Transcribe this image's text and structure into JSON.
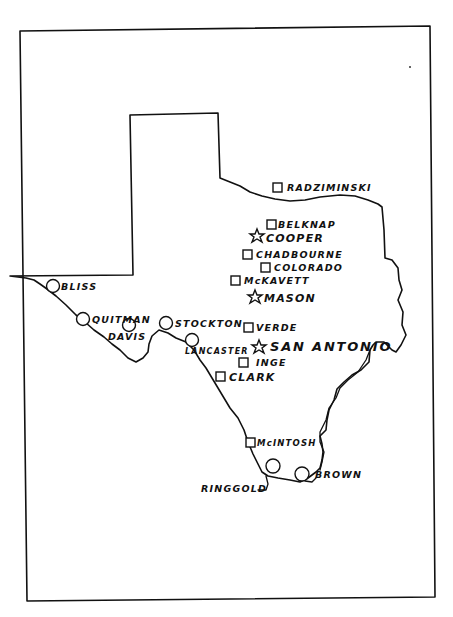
{
  "map": {
    "subject": "Texas frontier forts",
    "legend_symbols": {
      "square": "fort",
      "circle": "fort",
      "star": "fort / city"
    },
    "places": [
      {
        "id": "radziminski",
        "name": "RADZIMINSKI",
        "symbol": "square"
      },
      {
        "id": "belknap",
        "name": "BELKNAP",
        "symbol": "square"
      },
      {
        "id": "cooper",
        "name": "COOPER",
        "symbol": "star"
      },
      {
        "id": "chadbourne",
        "name": "CHADBOURNE",
        "symbol": "square"
      },
      {
        "id": "colorado",
        "name": "COLORADO",
        "symbol": "square"
      },
      {
        "id": "mckavett",
        "name": "McKAVETT",
        "symbol": "square"
      },
      {
        "id": "mason",
        "name": "MASON",
        "symbol": "star"
      },
      {
        "id": "bliss",
        "name": "BLISS",
        "symbol": "circle"
      },
      {
        "id": "quitman",
        "name": "QUITMAN",
        "symbol": "circle"
      },
      {
        "id": "davis",
        "name": "DAVIS",
        "symbol": "circle"
      },
      {
        "id": "stockton",
        "name": "STOCKTON",
        "symbol": "circle"
      },
      {
        "id": "lancaster",
        "name": "LANCASTER",
        "symbol": "circle"
      },
      {
        "id": "verde",
        "name": "VERDE",
        "symbol": "square"
      },
      {
        "id": "san_antonio",
        "name": "SAN ANTONIO",
        "symbol": "star"
      },
      {
        "id": "inge",
        "name": "INGE",
        "symbol": "square"
      },
      {
        "id": "clark",
        "name": "CLARK",
        "symbol": "square"
      },
      {
        "id": "mcintosh",
        "name": "McINTOSH",
        "symbol": "square"
      },
      {
        "id": "ringgold",
        "name": "RINGGOLD",
        "symbol": "circle"
      },
      {
        "id": "brown",
        "name": "BROWN",
        "symbol": "circle"
      }
    ]
  }
}
